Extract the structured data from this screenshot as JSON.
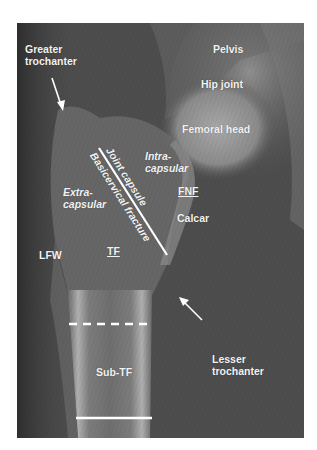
{
  "figure": {
    "type": "annotated hip radiograph",
    "colors": {
      "background": "#ffffff",
      "film_dark": "#3c3c3c",
      "film_mid": "#555555",
      "bone_light": "#9a9a9a",
      "label": "#f2f2f2"
    }
  },
  "labels": {
    "greater_trochanter_line1": "Greater",
    "greater_trochanter_line2": "trochanter",
    "pelvis": "Pelvis",
    "hip_joint": "Hip joint",
    "femoral_head": "Femoral head",
    "intra_capsular_line1": "Intra-",
    "intra_capsular_line2": "capsular",
    "extra_capsular_line1": "Extra-",
    "extra_capsular_line2": "capsular",
    "joint_capsule": "Joint capsule",
    "basicervical_fracture": "Basicervical fracture",
    "fnf": "FNF",
    "calcar": "Calcar",
    "lfw": "LFW",
    "tf": "TF",
    "lesser_trochanter_line1": "Lesser",
    "lesser_trochanter_line2": "trochanter",
    "sub_tf": "Sub-TF"
  },
  "annotations": {
    "diagonal_line": {
      "from": [
        99,
        148
      ],
      "to": [
        167,
        255
      ]
    },
    "dashed_line": {
      "y": 324,
      "x_from": 69,
      "x_to": 152
    },
    "solid_line": {
      "y": 418,
      "x_from": 76,
      "x_to": 152
    },
    "arrow_greater_trochanter": {
      "from": [
        52,
        78
      ],
      "to": [
        63,
        110
      ]
    },
    "arrow_lesser_trochanter": {
      "from": [
        202,
        320
      ],
      "to": [
        180,
        298
      ]
    }
  }
}
